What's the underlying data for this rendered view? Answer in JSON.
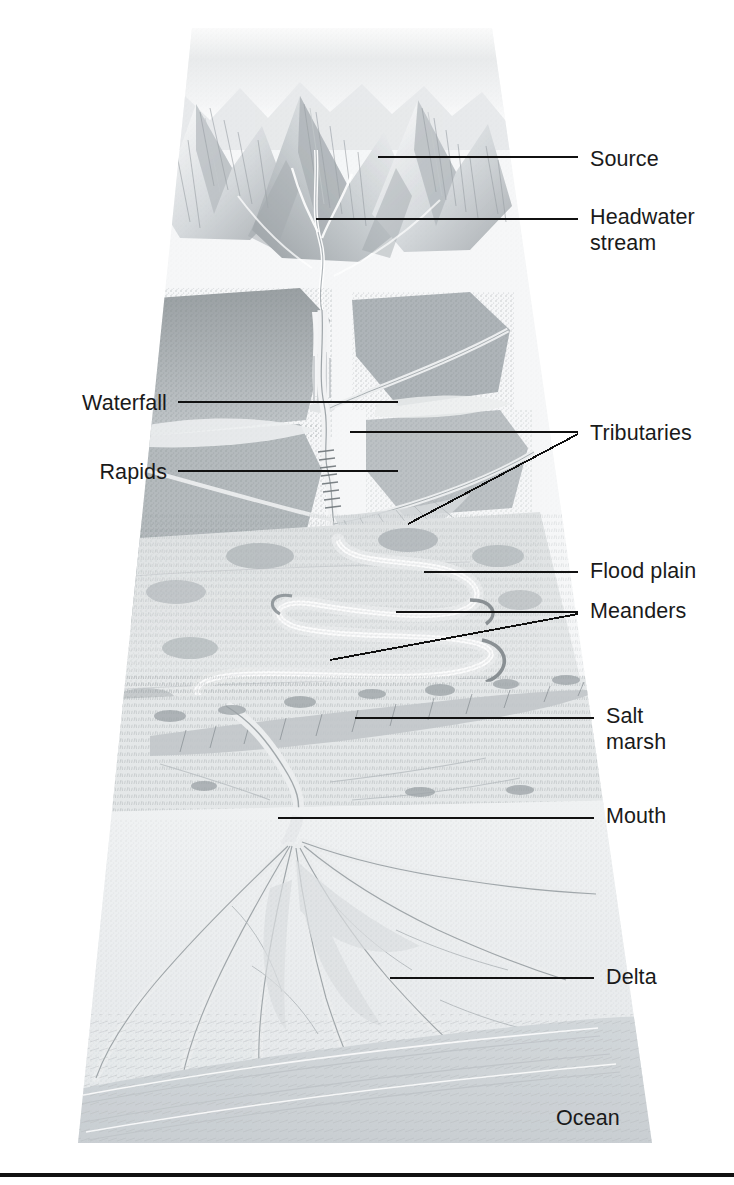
{
  "figure": {
    "type": "river-system-illustration",
    "medium": "pencil drawing",
    "frame_shape": "trapezoid, narrow at top, wide at bottom",
    "inline_text": {
      "ocean": "Ocean"
    },
    "colors": {
      "text": "#1a1a1a",
      "leader_line": "#111111",
      "rule": "#111111",
      "paper": "#ffffff",
      "sky": "#eef0f1",
      "mountain_light": "#f2f3f4",
      "mountain_shade": "#b9bdc0",
      "forest_dark": "#8d9296",
      "plain": "#e4e6e7",
      "water": "#c9ced2",
      "ocean": "#d9dde0"
    }
  },
  "labels": [
    {
      "id": "source",
      "text": "Source",
      "side": "right"
    },
    {
      "id": "headwater-stream",
      "text": "Headwater\nstream",
      "side": "right"
    },
    {
      "id": "waterfall",
      "text": "Waterfall",
      "side": "left"
    },
    {
      "id": "rapids",
      "text": "Rapids",
      "side": "left"
    },
    {
      "id": "tributaries",
      "text": "Tributaries",
      "side": "right"
    },
    {
      "id": "flood-plain",
      "text": "Flood plain",
      "side": "right"
    },
    {
      "id": "meanders",
      "text": "Meanders",
      "side": "right"
    },
    {
      "id": "salt-marsh",
      "text": "Salt\nmarsh",
      "side": "right"
    },
    {
      "id": "mouth",
      "text": "Mouth",
      "side": "right"
    },
    {
      "id": "delta",
      "text": "Delta",
      "side": "right"
    },
    {
      "id": "ocean",
      "text": "Ocean",
      "side": "inline"
    }
  ],
  "label_positions": {
    "source": {
      "x": 590,
      "y": 146
    },
    "headwater-stream": {
      "x": 590,
      "y": 204
    },
    "waterfall": {
      "x": 167,
      "y": 390
    },
    "rapids": {
      "x": 167,
      "y": 459
    },
    "tributaries": {
      "x": 590,
      "y": 420
    },
    "flood-plain": {
      "x": 590,
      "y": 558
    },
    "meanders": {
      "x": 590,
      "y": 598
    },
    "salt-marsh": {
      "x": 606,
      "y": 703
    },
    "mouth": {
      "x": 606,
      "y": 803
    },
    "delta": {
      "x": 606,
      "y": 964
    },
    "ocean": {
      "x": 556,
      "y": 1105
    }
  }
}
